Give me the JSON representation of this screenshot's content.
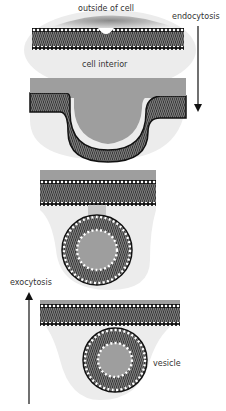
{
  "labels": {
    "outside": "outside of cell",
    "interior": "cell interior",
    "endocytosis": "endocytosis",
    "exocytosis": "exocytosis",
    "vesicle": "vesicle"
  },
  "stages": [
    {
      "id": 1,
      "description": "flat membrane with slight dimple"
    },
    {
      "id": 2,
      "description": "membrane invaginating (U-shaped pit)"
    },
    {
      "id": 3,
      "description": "vesicle budding, connected by neck"
    },
    {
      "id": 4,
      "description": "detached vesicle below membrane"
    }
  ],
  "colors": {
    "outside_gray": "#9e9e9e",
    "interior_light": "#ececec",
    "membrane_dark": "#2a2a2a",
    "head_white": "#ffffff",
    "arrow": "#111111"
  }
}
